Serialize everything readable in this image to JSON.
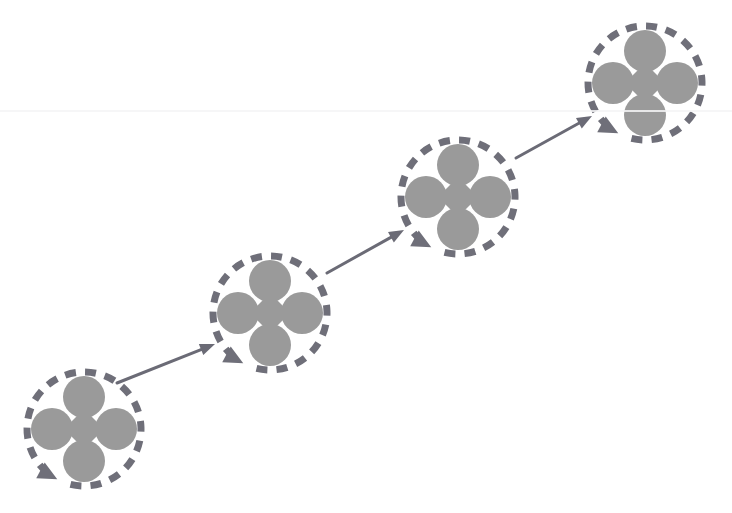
{
  "canvas": {
    "width": 732,
    "height": 513,
    "background": "#ffffff",
    "title": "Iterative cycle process chain"
  },
  "palette": {
    "shape_fill": "#9a9a9a",
    "cycle_stroke": "#6f6f79",
    "connector_stroke": "#6b6b76",
    "background": "#ffffff",
    "scanline": "#f4f4f6"
  },
  "geometry": {
    "cycle_radius": 57,
    "cycle_stroke_width": 7,
    "cycle_dash_on": 11,
    "cycle_dash_off": 9,
    "lobe_radius": 21,
    "lobe_offset": 32,
    "diamond_half": 20,
    "connector_stroke_width": 3,
    "connector_arrow_length": 15,
    "connector_arrow_half_width": 6,
    "cycle_arrow_length": 19,
    "cycle_arrow_half_width": 9
  },
  "artifacts": {
    "scanline_y": 110
  },
  "nodes": [
    {
      "id": "node-1",
      "label": "Cycle stage 1",
      "cx": 84,
      "cy": 429,
      "cycle_arrow_angle_deg": 118,
      "lobes": [
        "top-lobe",
        "left-lobe",
        "right-lobe",
        "bottom-lobe"
      ],
      "center_shape": "diamond"
    },
    {
      "id": "node-2",
      "label": "Cycle stage 2",
      "cx": 270,
      "cy": 313,
      "cycle_arrow_angle_deg": 118,
      "lobes": [
        "top-lobe",
        "left-lobe",
        "right-lobe",
        "bottom-lobe"
      ],
      "center_shape": "diamond"
    },
    {
      "id": "node-3",
      "label": "Cycle stage 3",
      "cx": 458,
      "cy": 197,
      "cycle_arrow_angle_deg": 118,
      "lobes": [
        "top-lobe",
        "left-lobe",
        "right-lobe",
        "bottom-lobe"
      ],
      "center_shape": "diamond"
    },
    {
      "id": "node-4",
      "label": "Cycle stage 4",
      "cx": 645,
      "cy": 83,
      "cycle_arrow_angle_deg": 118,
      "lobes": [
        "top-lobe",
        "left-lobe",
        "right-lobe",
        "bottom-lobe"
      ],
      "center_shape": "diamond"
    }
  ],
  "connectors": [
    {
      "id": "connector-1-2",
      "label": "Stage 1 to stage 2",
      "from": "node-1",
      "to": "node-2",
      "x1": 117,
      "y1": 383,
      "x2": 215,
      "y2": 344
    },
    {
      "id": "connector-2-3",
      "label": "Stage 2 to stage 3",
      "from": "node-2",
      "to": "node-3",
      "x1": 327,
      "y1": 273,
      "x2": 404,
      "y2": 230
    },
    {
      "id": "connector-3-4",
      "label": "Stage 3 to stage 4",
      "from": "node-3",
      "to": "node-4",
      "x1": 516,
      "y1": 158,
      "x2": 592,
      "y2": 116
    }
  ]
}
